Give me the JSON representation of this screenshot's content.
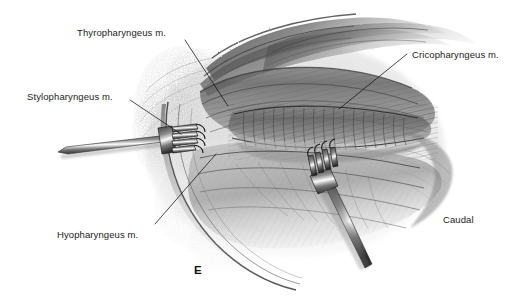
{
  "figure": {
    "panel_letter": "E",
    "orientation_note": "Caudal",
    "background_color": "#ffffff",
    "ink_color": "#2b2b2b",
    "label_color": "#1b1b1b",
    "width": 529,
    "height": 306,
    "medium": "graphite pencil anatomical illustration"
  },
  "labels": {
    "thyropharyngeus": "Thyropharyngeus m.",
    "stylopharyngeus": "Stylopharyngeus m.",
    "cricopharyngeus": "Cricopharyngeus m.",
    "hyopharyngeus": "Hyopharyngeus m."
  },
  "leader_lines": [
    {
      "name": "thyropharyngeus-leader",
      "x1": 185,
      "y1": 40,
      "x2": 228,
      "y2": 106
    },
    {
      "name": "stylopharyngeus-leader",
      "x1": 130,
      "y1": 100,
      "x2": 181,
      "y2": 134
    },
    {
      "name": "cricopharyngeus-leader",
      "x1": 407,
      "y1": 54,
      "x2": 339,
      "y2": 109
    },
    {
      "name": "hyopharyngeus-leader",
      "x1": 155,
      "y1": 224,
      "x2": 216,
      "y2": 154
    }
  ],
  "scene": {
    "description": "Surgical exposure of the canine pharynx showing the pharyngeal constrictor muscles retracted by two rake retractors",
    "structures": [
      "thyropharyngeus muscle",
      "stylopharyngeus muscle",
      "cricopharyngeus muscle",
      "hyopharyngeus muscle",
      "retracted skin and fascial flaps"
    ],
    "instruments": [
      {
        "name": "rake-retractor-left",
        "prongs": 4,
        "position": "left margin, tines pointing right"
      },
      {
        "name": "rake-retractor-right",
        "prongs": 4,
        "position": "lower right, tines pointing up-left"
      }
    ]
  }
}
